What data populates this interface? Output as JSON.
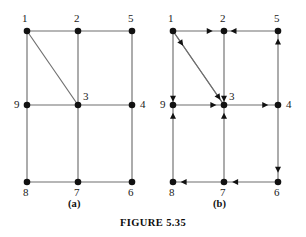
{
  "figure": {
    "caption": "FIGURE 5.35",
    "panels": [
      {
        "id": "a",
        "label": "(a)",
        "type": "undirected-graph"
      },
      {
        "id": "b",
        "label": "(b)",
        "type": "directed-graph"
      }
    ]
  },
  "graph_a": {
    "label": "(a)",
    "directed": false,
    "nodes": [
      {
        "id": "1",
        "label": "1",
        "x": 27,
        "y": 31,
        "label_x": 22,
        "label_y": 22
      },
      {
        "id": "2",
        "label": "2",
        "x": 78,
        "y": 31,
        "label_x": 74,
        "label_y": 22
      },
      {
        "id": "5",
        "label": "5",
        "x": 132,
        "y": 31,
        "label_x": 128,
        "label_y": 22
      },
      {
        "id": "9",
        "label": "9",
        "x": 27,
        "y": 105,
        "label_x": 14,
        "label_y": 108
      },
      {
        "id": "3",
        "label": "3",
        "x": 78,
        "y": 105,
        "label_x": 83,
        "label_y": 100
      },
      {
        "id": "4",
        "label": "4",
        "x": 132,
        "y": 105,
        "label_x": 140,
        "label_y": 108
      },
      {
        "id": "8",
        "label": "8",
        "x": 27,
        "y": 182,
        "label_x": 23,
        "label_y": 196
      },
      {
        "id": "7",
        "label": "7",
        "x": 78,
        "y": 182,
        "label_x": 74,
        "label_y": 196
      },
      {
        "id": "6",
        "label": "6",
        "x": 132,
        "y": 182,
        "label_x": 128,
        "label_y": 196
      }
    ],
    "edges": [
      {
        "from": "1",
        "to": "2"
      },
      {
        "from": "2",
        "to": "5"
      },
      {
        "from": "1",
        "to": "9"
      },
      {
        "from": "2",
        "to": "3"
      },
      {
        "from": "5",
        "to": "4"
      },
      {
        "from": "1",
        "to": "3"
      },
      {
        "from": "9",
        "to": "3"
      },
      {
        "from": "3",
        "to": "4"
      },
      {
        "from": "9",
        "to": "8"
      },
      {
        "from": "3",
        "to": "7"
      },
      {
        "from": "4",
        "to": "6"
      },
      {
        "from": "8",
        "to": "7"
      },
      {
        "from": "7",
        "to": "6"
      }
    ]
  },
  "graph_b": {
    "label": "(b)",
    "directed": true,
    "nodes": [
      {
        "id": "1",
        "label": "1",
        "x": 27,
        "y": 31,
        "label_x": 22,
        "label_y": 22
      },
      {
        "id": "2",
        "label": "2",
        "x": 78,
        "y": 31,
        "label_x": 74,
        "label_y": 22
      },
      {
        "id": "5",
        "label": "5",
        "x": 132,
        "y": 31,
        "label_x": 128,
        "label_y": 22
      },
      {
        "id": "9",
        "label": "9",
        "x": 27,
        "y": 105,
        "label_x": 14,
        "label_y": 108
      },
      {
        "id": "3",
        "label": "3",
        "x": 78,
        "y": 105,
        "label_x": 83,
        "label_y": 100
      },
      {
        "id": "4",
        "label": "4",
        "x": 132,
        "y": 105,
        "label_x": 140,
        "label_y": 108
      },
      {
        "id": "8",
        "label": "8",
        "x": 27,
        "y": 182,
        "label_x": 23,
        "label_y": 196
      },
      {
        "id": "7",
        "label": "7",
        "x": 78,
        "y": 182,
        "label_x": 74,
        "label_y": 196
      },
      {
        "id": "6",
        "label": "6",
        "x": 132,
        "y": 182,
        "label_x": 128,
        "label_y": 196
      }
    ],
    "edges": [
      {
        "from": "1",
        "to": "2",
        "arrow_at": 0.78
      },
      {
        "from": "5",
        "to": "2",
        "arrow_at": 0.88
      },
      {
        "from": "1",
        "to": "9",
        "arrow_at": 1.0
      },
      {
        "from": "2",
        "to": "3",
        "arrow_at": 1.0
      },
      {
        "from": "4",
        "to": "5",
        "arrow_at": 0.9
      },
      {
        "from": "1",
        "to": "3",
        "arrow_at": 0.2
      },
      {
        "from": "1",
        "to": "3",
        "arrow_at": 0.93
      },
      {
        "from": "9",
        "to": "3",
        "arrow_at": 0.85
      },
      {
        "from": "3",
        "to": "4",
        "arrow_at": 0.82
      },
      {
        "from": "8",
        "to": "9",
        "arrow_at": 0.9
      },
      {
        "from": "7",
        "to": "3",
        "arrow_at": 0.9
      },
      {
        "from": "4",
        "to": "6",
        "arrow_at": 0.88
      },
      {
        "from": "7",
        "to": "8",
        "arrow_at": 0.85
      },
      {
        "from": "6",
        "to": "7",
        "arrow_at": 0.85
      }
    ]
  },
  "colors": {
    "node": "#111111",
    "edge": "#6f6f6f",
    "arrow": "#111111",
    "text": "#1a1a1a",
    "background": "#ffffff"
  }
}
